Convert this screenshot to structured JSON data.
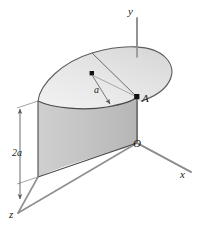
{
  "figure": {
    "labels": {
      "y_axis": "y",
      "x_axis": "x",
      "z_axis": "z",
      "origin": "O",
      "point_a": "A",
      "radius": "a",
      "height": "2a"
    },
    "colors": {
      "background": "#ffffff",
      "vertical_face": "#c6c6c6",
      "vertical_face_dark": "#b9b9b9",
      "top_disk": "#e4e4e4",
      "top_disk_light": "#f1f1f1",
      "outline": "#4a4a4a",
      "axis": "#8c8c8c",
      "dimension": "#6a6a6a",
      "marker": "#111111",
      "text": "#1a1a1a"
    },
    "geometry": {
      "origin_point": [
        137,
        143
      ],
      "y_axis_top": [
        137,
        18
      ],
      "x_axis_end": [
        191,
        172
      ],
      "z_axis_end": [
        18,
        213
      ],
      "point_a": [
        137,
        97
      ],
      "arc_center": [
        92,
        74
      ],
      "vertical_face_height_px": 76,
      "radius_label_value": "a",
      "height_label_value": "2a"
    }
  }
}
